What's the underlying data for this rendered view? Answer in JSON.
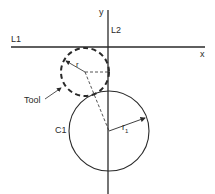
{
  "diagram": {
    "type": "geometry-construction",
    "labels": {
      "y_axis": "y",
      "x_axis": "x",
      "line1": "L1",
      "line2": "L2",
      "tool": "Tool",
      "circle": "C1",
      "tool_radius": "r",
      "circle_radius": "r",
      "circle_radius_sub": "1"
    },
    "colors": {
      "stroke": "#2a2a2a",
      "background": "#ffffff"
    },
    "geometry": {
      "x_axis_line": {
        "x1": 8,
        "x2": 205,
        "y": 47
      },
      "y_axis_line": {
        "x": 108,
        "y1": 10,
        "y2": 194
      },
      "circle_c1": {
        "cx": 109,
        "cy": 131,
        "r": 40
      },
      "tool_circle": {
        "cx": 85,
        "cy": 72,
        "r": 24,
        "dashed": true
      }
    }
  }
}
